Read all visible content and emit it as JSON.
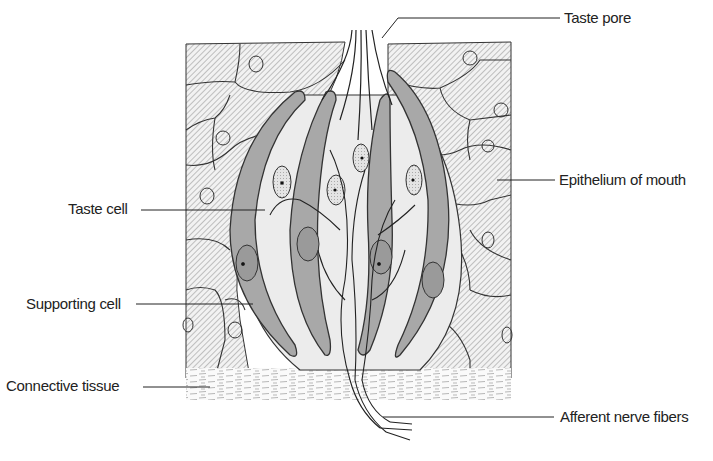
{
  "diagram": {
    "labels": {
      "taste_pore": "Taste pore",
      "epithelium": "Epithelium of mouth",
      "taste_cell": "Taste cell",
      "supporting_cell": "Supporting cell",
      "connective_tissue": "Connective tissue",
      "afferent_nerve": "Afferent nerve fibers"
    },
    "colors": {
      "ink": "#222222",
      "hatch": "#9a9a9a",
      "supporting_fill": "#a8a8a8",
      "taste_fill": "#e2e2e2",
      "background": "#ffffff"
    }
  }
}
